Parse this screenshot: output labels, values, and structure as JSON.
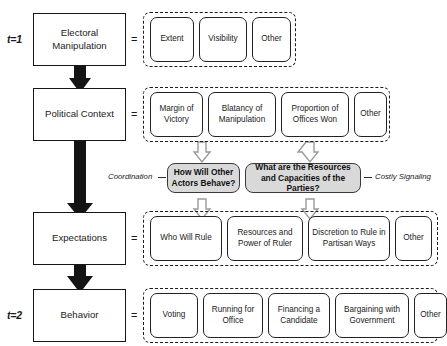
{
  "diagram": {
    "colors": {
      "box_border": "#161616",
      "component_border": "#222222",
      "dashed_border": "#1b1b1b",
      "gray_fill": "#d9d9d9",
      "gray_border": "#3a3a3a",
      "arrow_black": "#111111",
      "arrow_gray_stroke": "#8c8c8c",
      "background": "#ffffff"
    },
    "time_labels": [
      {
        "name": "t1",
        "prefix": "t",
        "suffix": "=1",
        "text": "t=1"
      },
      {
        "name": "t2",
        "prefix": "t",
        "suffix": "=2",
        "text": "t=2"
      }
    ],
    "equals_sign": "=",
    "rows": [
      {
        "id": "electoral-manipulation",
        "time_label": "t=1",
        "concept": "Electoral Manipulation",
        "components": [
          "Extent",
          "Visibility",
          "Other"
        ]
      },
      {
        "id": "political-context",
        "time_label": "",
        "concept": "Political Context",
        "components": [
          "Margin of Victory",
          "Blatancy of Manipulation",
          "Proportion of Offices Won",
          "Other"
        ]
      },
      {
        "id": "expectations",
        "time_label": "",
        "concept": "Expectations",
        "components": [
          "Who Will Rule",
          "Resources and Power of Ruler",
          "Discretion to Rule in Partisan Ways",
          "Other"
        ]
      },
      {
        "id": "behavior",
        "time_label": "t=2",
        "concept": "Behavior",
        "components": [
          "Voting",
          "Running for Office",
          "Financing a Candidate",
          "Bargaining with Government",
          "Other"
        ]
      }
    ],
    "mechanisms": [
      {
        "id": "coordination",
        "label": "Coordination",
        "question": "How Will Other Actors Behave?"
      },
      {
        "id": "costly-signaling",
        "label": "Costly Signaling",
        "question": "What are the Resources and Capacities of the Parties?"
      }
    ]
  }
}
